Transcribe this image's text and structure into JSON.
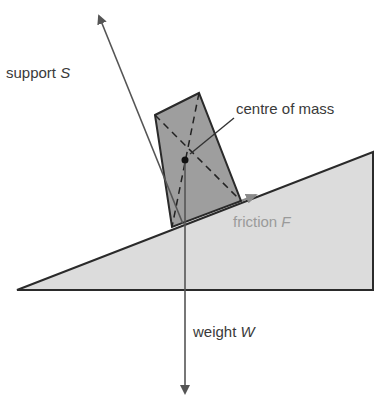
{
  "diagram": {
    "title": "",
    "labels": {
      "support": {
        "text": "support",
        "symbol": "S"
      },
      "centre_of_mass": {
        "text": "centre of mass"
      },
      "friction": {
        "text": "friction",
        "symbol": "F"
      },
      "weight": {
        "text": "weight",
        "symbol": "W"
      }
    },
    "colors": {
      "incline_fill": "#dcdcdc",
      "block_fill": "#9e9e9e",
      "outline": "#2a2a2a",
      "arrow": "#555555",
      "friction_arrow": "#8a8a8a",
      "friction_text": "#9a9a9a"
    },
    "shapes": {
      "incline": [
        [
          17,
          290
        ],
        [
          373,
          152
        ],
        [
          373,
          290
        ]
      ],
      "block": [
        [
          155,
          115
        ],
        [
          199,
          93
        ],
        [
          241,
          201
        ],
        [
          172,
          227
        ]
      ],
      "centre_of_mass": [
        185,
        160
      ],
      "support_arrow": {
        "from": [
          172,
          227
        ],
        "to": [
          98,
          12
        ]
      },
      "weight_arrow": {
        "from": [
          185,
          160
        ],
        "to": [
          185,
          395
        ]
      },
      "friction_arrow": {
        "from": [
          241,
          201
        ],
        "to": [
          255,
          196
        ]
      }
    }
  }
}
